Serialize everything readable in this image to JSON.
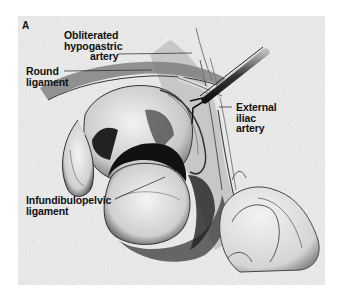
{
  "figure": {
    "panel_letter": "A",
    "type": "surgical anatomical illustration",
    "labels": [
      {
        "id": "obliterated-hypogastric-artery",
        "lines": [
          "Obliterated",
          "hypogastric",
          "artery"
        ]
      },
      {
        "id": "round-ligament",
        "lines": [
          "Round",
          "ligament"
        ]
      },
      {
        "id": "external-iliac-artery",
        "lines": [
          "External",
          "iliac",
          "artery"
        ]
      },
      {
        "id": "infundibulopelvic-ligament",
        "lines": [
          "Infundibulopelvic",
          "ligament"
        ]
      }
    ],
    "colors": {
      "background": "#ffffff",
      "stipple": "#e4e4e4",
      "ink": "#1a1a1a",
      "shadow": "#2a2a2a"
    }
  }
}
